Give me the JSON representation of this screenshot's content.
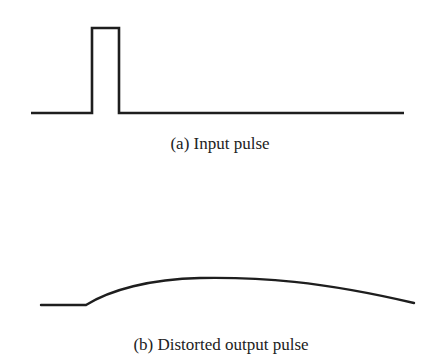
{
  "diagram": {
    "colors": {
      "stroke": "#1e1e1e",
      "text": "#222222",
      "background": "#ffffff"
    },
    "panels": [
      {
        "id": "a",
        "caption": "(a) Input pulse",
        "shape": "rectangular-pulse"
      },
      {
        "id": "b",
        "caption": "(b) Distorted output pulse",
        "shape": "smoothed-broadened-pulse"
      }
    ]
  }
}
